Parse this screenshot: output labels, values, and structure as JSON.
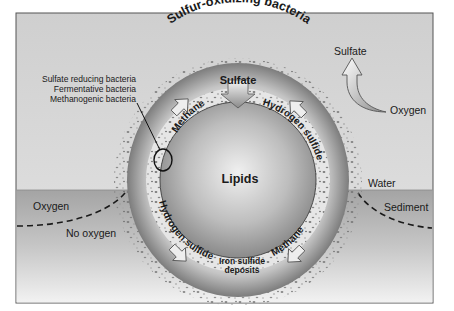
{
  "diagram": {
    "colors": {
      "background_top": "#d6d6d6",
      "background_bottom": "#f2f2f2",
      "sediment": "#a9a9a9",
      "frame": "#555555",
      "text": "#1a1a1a"
    },
    "labels": {
      "sulfur_oxidizing": "Sulfur-oxidizing bacteria",
      "sulfate_inner": "Sulfate",
      "sulfate_outer": "Sulfate",
      "oxygen_right": "Oxygen",
      "lipids": "Lipids",
      "methane_upper": "Methane",
      "methane_lower": "Methane",
      "hydrogen_sulfide_upper": "Hydrogen sulfide",
      "hydrogen_sulfide_lower": "Hydrogen sulfide",
      "iron_sulfide_1": "Iron sulfide",
      "iron_sulfide_2": "deposits",
      "water": "Water",
      "sediment": "Sediment",
      "oxygen_left": "Oxygen",
      "no_oxygen": "No oxygen"
    },
    "bacteria_legend": [
      "Sulfate reducing bacteria",
      "Fermentative bacteria",
      "Methanogenic bacteria"
    ]
  }
}
